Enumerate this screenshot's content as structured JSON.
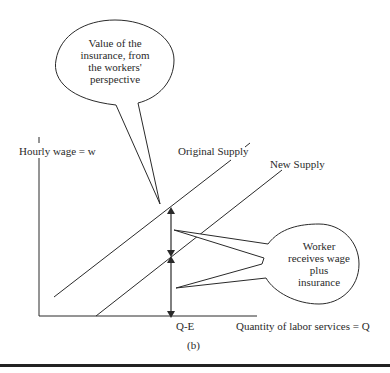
{
  "diagram": {
    "type": "supply-shift",
    "caption": "(b)",
    "y_axis_label": "Hourly wage = w",
    "x_axis_label": "Quantity of labor services = Q",
    "x_marker_label": "Q-E",
    "curves": [
      {
        "name": "Original Supply",
        "label": "Original Supply"
      },
      {
        "name": "New Supply",
        "label": "New Supply"
      }
    ],
    "callouts": {
      "top": {
        "lines": [
          "Value of the",
          "insurance, from",
          "the workers'",
          "perspective"
        ]
      },
      "right": {
        "lines": [
          "Worker",
          "receives wage",
          "plus",
          "insurance"
        ]
      }
    },
    "colors": {
      "ink": "#2a2a2a",
      "background": "#ffffff"
    }
  }
}
